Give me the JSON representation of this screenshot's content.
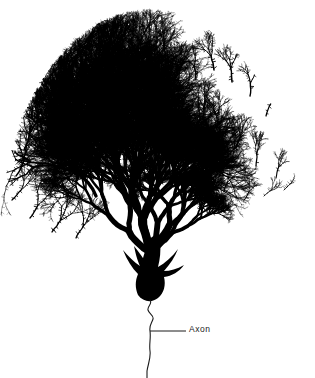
{
  "figure": {
    "style": "ink-line-drawing",
    "width": 315,
    "height": 378,
    "background_color": "#ffffff",
    "ink_color": "#000000"
  },
  "labels": {
    "axon": "Axon"
  },
  "annotations": {
    "leader_line": {
      "x1": 150,
      "y1": 331,
      "x2": 186,
      "y2": 331,
      "stroke_width": 1
    }
  },
  "structures": {
    "soma": {
      "name": "Soma (cell body)",
      "center_x": 152,
      "center_y": 277,
      "width": 40,
      "height": 48,
      "fill": "#000000"
    },
    "axon": {
      "name": "Axon",
      "start_x": 150,
      "start_y": 300,
      "end_x": 147,
      "end_y": 378,
      "stroke_width": 1.1,
      "waviness": "high"
    },
    "primary_trunk": {
      "name": "Primary dendritic trunk",
      "base_x": 150,
      "base_y": 258,
      "apex_x": 151,
      "apex_y": 248,
      "stroke_width": 9
    },
    "dendritic_arbor": {
      "name": "Dendritic arbor",
      "span_left": 3,
      "span_right": 306,
      "span_top": 11,
      "span_bottom": 260,
      "left_branch": {
        "label": "Left primary dendrite",
        "angle_deg": -118,
        "length": 72,
        "width": 8.5,
        "density": "very-dense"
      },
      "right_branch": {
        "label": "Right primary dendrite",
        "angle_deg": -48,
        "length": 66,
        "width": 7.0,
        "density": "moderate"
      }
    }
  },
  "render_params": {
    "seed": 20240617,
    "max_depth": 11,
    "branch_split_min": 2,
    "branch_split_max": 3,
    "length_decay": 0.775,
    "width_decay": 0.745,
    "spread_deg": 40,
    "jitter_deg": 20,
    "segment_curve": 0.3,
    "spine_density": 0.72,
    "min_width": 0.32,
    "upward_bias": 0.34
  }
}
